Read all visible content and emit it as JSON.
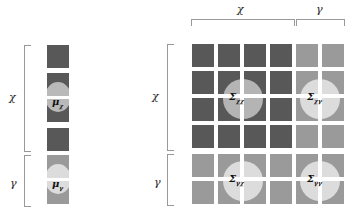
{
  "vector": {
    "labels": {
      "x": "χ",
      "y": "γ"
    },
    "mu_x": "μ",
    "mu_x_sub": "χ",
    "mu_y": "μ",
    "mu_y_sub": "γ"
  },
  "matrix": {
    "col_labels": {
      "x": "χ",
      "y": "γ"
    },
    "row_labels": {
      "x": "χ",
      "y": "γ"
    },
    "blocks": {
      "xx": {
        "sym": "Σ",
        "sub": "χχ"
      },
      "xy": {
        "sym": "Σ",
        "sub": "χγ"
      },
      "yx": {
        "sym": "Σ",
        "sub": "γχ"
      },
      "yy": {
        "sym": "Σ",
        "sub": "γγ"
      }
    }
  },
  "colors": {
    "dark": "#585858",
    "light": "#9a9a9a",
    "circle_mid": "#b9b9b9",
    "circle_light": "#dcdcdc",
    "bracket": "#999999"
  }
}
